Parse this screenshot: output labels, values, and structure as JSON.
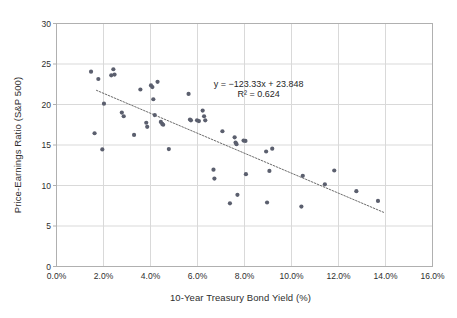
{
  "chart_data": {
    "type": "scatter",
    "title": "",
    "xlabel": "10-Year Treasury Bond Yield (%)",
    "ylabel": "Price-Earnings Ratio (S&P 500)",
    "xlim": [
      0.0,
      16.0
    ],
    "ylim": [
      0,
      30
    ],
    "xticks": [
      "0.0%",
      "2.0%",
      "4.0%",
      "6.0%",
      "8.0%",
      "10.0%",
      "12.0%",
      "14.0%",
      "16.0%"
    ],
    "xtick_values": [
      0.0,
      2.0,
      4.0,
      6.0,
      8.0,
      10.0,
      12.0,
      14.0,
      16.0
    ],
    "yticks": [
      "0",
      "5",
      "10",
      "15",
      "20",
      "25",
      "30"
    ],
    "ytick_values": [
      0,
      5,
      10,
      15,
      20,
      25,
      30
    ],
    "grid": true,
    "grid_axis": "both",
    "legend": false,
    "marker_color": "#5b5f6e",
    "marker_size": 4,
    "series": [
      {
        "name": "S&P 500 P/E vs 10-Year Treasury Yield",
        "points": [
          [
            1.47,
            24.05
          ],
          [
            1.62,
            16.45
          ],
          [
            1.78,
            23.15
          ],
          [
            1.95,
            14.45
          ],
          [
            2.02,
            20.1
          ],
          [
            2.33,
            23.6
          ],
          [
            2.42,
            24.35
          ],
          [
            2.47,
            23.7
          ],
          [
            2.78,
            19.0
          ],
          [
            2.86,
            18.55
          ],
          [
            3.3,
            16.25
          ],
          [
            3.57,
            21.85
          ],
          [
            3.82,
            17.75
          ],
          [
            3.86,
            17.25
          ],
          [
            4.02,
            22.35
          ],
          [
            4.08,
            22.15
          ],
          [
            4.12,
            20.65
          ],
          [
            4.18,
            18.7
          ],
          [
            4.3,
            22.8
          ],
          [
            4.44,
            17.85
          ],
          [
            4.5,
            17.6
          ],
          [
            4.54,
            17.5
          ],
          [
            4.78,
            14.5
          ],
          [
            5.62,
            21.3
          ],
          [
            5.68,
            18.15
          ],
          [
            5.72,
            18.05
          ],
          [
            5.98,
            18.05
          ],
          [
            6.06,
            17.95
          ],
          [
            6.22,
            19.25
          ],
          [
            6.28,
            18.55
          ],
          [
            6.33,
            18.05
          ],
          [
            6.68,
            11.95
          ],
          [
            6.72,
            10.85
          ],
          [
            7.06,
            16.7
          ],
          [
            7.38,
            7.8
          ],
          [
            7.58,
            15.95
          ],
          [
            7.62,
            15.3
          ],
          [
            7.66,
            15.1
          ],
          [
            7.7,
            8.85
          ],
          [
            7.96,
            15.55
          ],
          [
            8.04,
            15.5
          ],
          [
            8.06,
            11.4
          ],
          [
            8.92,
            14.2
          ],
          [
            8.96,
            7.9
          ],
          [
            9.06,
            11.8
          ],
          [
            9.18,
            14.55
          ],
          [
            10.42,
            7.4
          ],
          [
            10.48,
            11.2
          ],
          [
            11.42,
            10.15
          ],
          [
            11.82,
            11.85
          ],
          [
            12.76,
            9.3
          ],
          [
            13.68,
            8.1
          ]
        ]
      }
    ],
    "trendline": {
      "equation": "y = −123.33x + 23.848",
      "r_squared_label": "R² = 0.624",
      "slope": -123.33,
      "intercept": 23.848,
      "r_squared": 0.624,
      "style": "dotted",
      "color": "#6b6b6b",
      "x_start": 1.7,
      "y_start": 21.75,
      "x_end": 13.95,
      "y_end": 6.65
    }
  },
  "annotations": {
    "equation_line1": "y = −123.33x + 23.848",
    "equation_line2": "R² = 0.624"
  },
  "colors": {
    "marker": "#5b5f6e",
    "gridline": "#d9d9d9",
    "axis": "#b0b0b0",
    "text": "#2e2e2e",
    "trendline": "#6b6b6b",
    "background": "#ffffff"
  }
}
